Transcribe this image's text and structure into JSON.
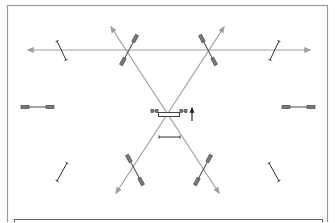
{
  "canvas": {
    "width": 335,
    "height": 222,
    "background": "#ffffff"
  },
  "colors": {
    "frame": "#9a9a9a",
    "arrow": "#a0a0a0",
    "fixture": "#4a4a4a",
    "fixture_fill": "#7a7a7a",
    "marker": "#333333"
  },
  "frame": {
    "x": 7.5,
    "y": 5.5,
    "w": 320,
    "h": 230
  },
  "inner_box": {
    "x": 14.5,
    "y": 219.5,
    "w": 308,
    "h": 20
  },
  "arrows": [
    {
      "name": "horizontal-arrow",
      "x1": 28,
      "y1": 50,
      "x2": 310,
      "y2": 50,
      "bidirectional": true
    },
    {
      "name": "diagonal-arrow-nw-se",
      "x1": 111,
      "y1": 27,
      "x2": 219,
      "y2": 193,
      "bidirectional": true
    },
    {
      "name": "diagonal-arrow-ne-sw",
      "x1": 224,
      "y1": 27,
      "x2": 116,
      "y2": 193,
      "bidirectional": true
    }
  ],
  "dumbbells": [
    {
      "name": "fixture-top-left-diag",
      "x1": 121,
      "y1": 65,
      "x2": 137,
      "y2": 35
    },
    {
      "name": "fixture-top-right-diag",
      "x1": 200,
      "y1": 35,
      "x2": 216,
      "y2": 65
    },
    {
      "name": "fixture-bottom-left-diag",
      "x1": 127,
      "y1": 155,
      "x2": 143,
      "y2": 185
    },
    {
      "name": "fixture-bottom-right-diag",
      "x1": 195,
      "y1": 185,
      "x2": 211,
      "y2": 155
    },
    {
      "name": "fixture-left-horizontal",
      "x1": 21,
      "y1": 107,
      "x2": 54,
      "y2": 107
    },
    {
      "name": "fixture-right-horizontal",
      "x1": 282,
      "y1": 107,
      "x2": 315,
      "y2": 107
    },
    {
      "name": "fixture-center-left",
      "x1": 151,
      "y1": 111,
      "x2": 158,
      "y2": 111
    },
    {
      "name": "fixture-center-right",
      "x1": 180,
      "y1": 111,
      "x2": 187,
      "y2": 111
    }
  ],
  "i_markers": [
    {
      "name": "marker-top-left",
      "x1": 57,
      "y1": 41,
      "x2": 66,
      "y2": 60
    },
    {
      "name": "marker-top-right",
      "x1": 279,
      "y1": 41,
      "x2": 270,
      "y2": 60
    },
    {
      "name": "marker-bottom-left",
      "x1": 67,
      "y1": 163,
      "x2": 57,
      "y2": 181
    },
    {
      "name": "marker-bottom-right",
      "x1": 269,
      "y1": 163,
      "x2": 279,
      "y2": 181
    },
    {
      "name": "marker-center-below",
      "x1": 159,
      "y1": 137,
      "x2": 180,
      "y2": 137
    }
  ],
  "center_box": {
    "x": 158.5,
    "y": 112.5,
    "w": 21,
    "h": 4
  },
  "up_arrow": {
    "x": 192,
    "y1": 121,
    "y2": 108
  }
}
